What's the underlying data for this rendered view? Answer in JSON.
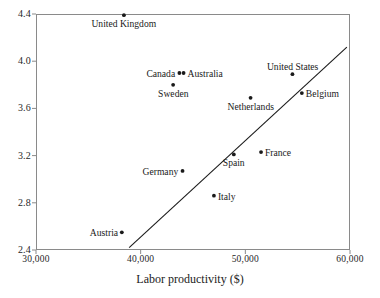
{
  "chart_data": {
    "type": "scatter",
    "title": "",
    "xlabel": "Labor productivity ($)",
    "ylabel": "",
    "xlim": [
      30000,
      60000
    ],
    "ylim": [
      2.4,
      4.4
    ],
    "grid": false,
    "legend": "none",
    "x_ticks": [
      {
        "value": 30000,
        "label": "30,000"
      },
      {
        "value": 40000,
        "label": "40,000"
      },
      {
        "value": 50000,
        "label": "50,000"
      },
      {
        "value": 60000,
        "label": "60,000"
      }
    ],
    "y_ticks": [
      {
        "value": 4.4,
        "label": "4.4"
      },
      {
        "value": 4.0,
        "label": "4.0"
      },
      {
        "value": 3.6,
        "label": "3.6"
      },
      {
        "value": 3.2,
        "label": "3.2"
      },
      {
        "value": 2.8,
        "label": "2.8"
      },
      {
        "value": 2.4,
        "label": "2.4"
      }
    ],
    "points": [
      {
        "name": "United Kingdom",
        "x": 38400,
        "y": 4.39,
        "label_pos": "below"
      },
      {
        "name": "Canada",
        "x": 43700,
        "y": 3.9,
        "label_pos": "left"
      },
      {
        "name": "Australia",
        "x": 44100,
        "y": 3.9,
        "label_pos": "right"
      },
      {
        "name": "Sweden",
        "x": 43100,
        "y": 3.8,
        "label_pos": "below"
      },
      {
        "name": "United States",
        "x": 54500,
        "y": 3.89,
        "label_pos": "above"
      },
      {
        "name": "Belgium",
        "x": 55400,
        "y": 3.73,
        "label_pos": "right"
      },
      {
        "name": "Netherlands",
        "x": 50500,
        "y": 3.69,
        "label_pos": "below"
      },
      {
        "name": "France",
        "x": 51500,
        "y": 3.23,
        "label_pos": "right"
      },
      {
        "name": "Spain",
        "x": 48900,
        "y": 3.21,
        "label_pos": "below"
      },
      {
        "name": "Germany",
        "x": 44000,
        "y": 3.07,
        "label_pos": "left"
      },
      {
        "name": "Italy",
        "x": 47000,
        "y": 2.86,
        "label_pos": "right"
      },
      {
        "name": "Austria",
        "x": 38200,
        "y": 2.55,
        "label_pos": "left"
      }
    ],
    "trend_line": {
      "x_start": 38900,
      "y_start": 2.42,
      "x_end": 59700,
      "y_end": 4.12,
      "color": "#1a1a1a"
    },
    "marker_color": "#1a1a1a",
    "axis_color": "#8a8a8a"
  }
}
